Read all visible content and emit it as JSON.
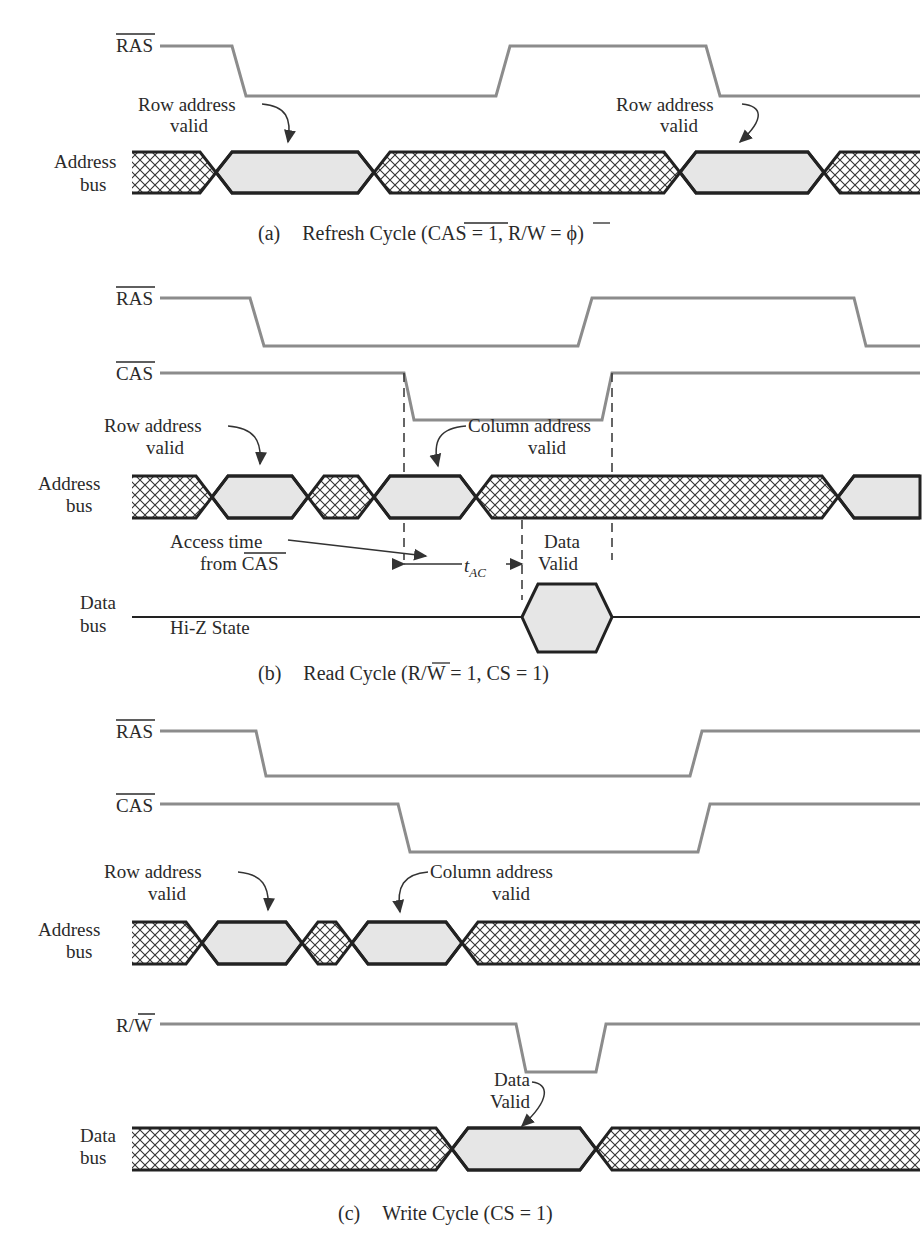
{
  "figure": {
    "colors": {
      "signal_line": "#8c8c8c",
      "bus_outline": "#222222",
      "valid_fill": "#e6e6e6",
      "hatch": "#333333",
      "text": "#2a2a2a"
    },
    "panels": [
      {
        "id": "a",
        "caption": "(a)   Refresh Cycle (CAS = 1, R/W = ϕ)",
        "caption_parts": {
          "prefix": "(a)",
          "title": "Refresh Cycle (",
          "cas": "CAS",
          "mid": " = 1, R/",
          "w": "W",
          "end": " = ϕ)"
        },
        "signals": [
          {
            "name": "RAS",
            "overbar": true
          },
          {
            "name": "Address\nbus",
            "line1": "Address",
            "line2": "bus"
          }
        ],
        "annotations": [
          {
            "line1": "Row address",
            "line2": "valid"
          },
          {
            "line1": "Row address",
            "line2": "valid"
          }
        ]
      },
      {
        "id": "b",
        "caption_parts": {
          "prefix": "(b)",
          "title": "Read Cycle (R/",
          "w": "W",
          "end": " = 1, CS = 1)"
        },
        "signals": [
          {
            "name": "RAS",
            "overbar": true
          },
          {
            "name": "CAS",
            "overbar": true
          },
          {
            "line1": "Address",
            "line2": "bus"
          },
          {
            "line1": "Data",
            "line2": "bus"
          }
        ],
        "annotations": {
          "row": {
            "line1": "Row address",
            "line2": "valid"
          },
          "col": {
            "line1": "Column address",
            "line2": "valid"
          },
          "access": {
            "line1": "Access time",
            "line2": "from",
            "cas": "CAS"
          },
          "tac": {
            "t": "t",
            "sub": "AC"
          },
          "data": {
            "line1": "Data",
            "line2": "Valid"
          },
          "hiz": "Hi-Z State"
        }
      },
      {
        "id": "c",
        "caption_parts": {
          "prefix": "(c)",
          "title": "Write Cycle (CS = 1)"
        },
        "signals": [
          {
            "name": "RAS",
            "overbar": true
          },
          {
            "name": "CAS",
            "overbar": true
          },
          {
            "line1": "Address",
            "line2": "bus"
          },
          {
            "name": "R/W",
            "r": "R/",
            "w": "W"
          },
          {
            "line1": "Data",
            "line2": "bus"
          }
        ],
        "annotations": {
          "row": {
            "line1": "Row address",
            "line2": "valid"
          },
          "col": {
            "line1": "Column address",
            "line2": "valid"
          },
          "data": {
            "line1": "Data",
            "line2": "Valid"
          }
        }
      }
    ],
    "footer_fragment": "11.7   (a) Dynamic RAM..."
  }
}
